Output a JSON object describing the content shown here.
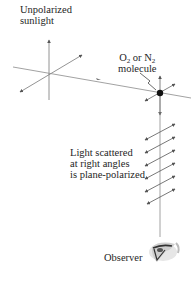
{
  "labels": {
    "sunlight_line1": "Unpolarized",
    "sunlight_line2": "sunlight",
    "molecule_o": "O",
    "molecule_sub1": "2",
    "molecule_or": " or N",
    "molecule_sub2": "2",
    "molecule_line2": "molecule",
    "scatter_line1": "Light scattered",
    "scatter_line2": "at right angles",
    "scatter_line3": "is plane-polarized",
    "observer": "Observer"
  },
  "icons": {
    "observer_eye": "eye-icon",
    "molecule": "molecule-dot-icon"
  },
  "colors": {
    "line": "#8a8a8a",
    "arrow": "#555555",
    "dot": "#111111",
    "text": "#1e1e1e"
  }
}
